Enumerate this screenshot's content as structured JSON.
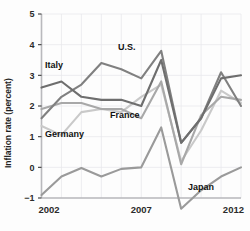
{
  "chart_data": {
    "type": "line",
    "title": "",
    "xlabel": "",
    "ylabel": "Inflation rate (percent)",
    "xlim": [
      2002,
      2012
    ],
    "ylim": [
      -1,
      5
    ],
    "grid": true,
    "legend_position": "inline-annotations",
    "x": [
      2002,
      2003,
      2004,
      2005,
      2006,
      2007,
      2008,
      2009,
      2010,
      2011,
      2012
    ],
    "y_ticks": [
      -1,
      0,
      1,
      2,
      3,
      4,
      5
    ],
    "y_tick_labels": [
      "−1",
      "0",
      "1",
      "2",
      "3",
      "4",
      "5"
    ],
    "x_ticks": [
      2002,
      2007,
      2012
    ],
    "x_tick_labels": [
      "2002",
      "2007",
      "2012"
    ],
    "series": [
      {
        "name": "Italy",
        "color": "#6e6e6e",
        "values": [
          2.6,
          2.8,
          2.3,
          2.2,
          2.2,
          2.0,
          3.5,
          0.8,
          1.6,
          2.9,
          3.0
        ]
      },
      {
        "name": "U.S.",
        "color": "#808080",
        "values": [
          1.6,
          2.3,
          2.7,
          3.4,
          3.2,
          2.9,
          3.8,
          0.8,
          1.6,
          3.1,
          2.0
        ]
      },
      {
        "name": "France",
        "color": "#a8a8a8",
        "values": [
          1.9,
          2.1,
          2.1,
          1.9,
          1.9,
          1.6,
          2.8,
          0.1,
          1.7,
          2.3,
          2.2
        ]
      },
      {
        "name": "Germany",
        "color": "#c9c9c9",
        "values": [
          1.35,
          1.05,
          1.8,
          1.9,
          1.8,
          2.3,
          2.7,
          0.2,
          1.2,
          2.5,
          2.1
        ]
      },
      {
        "name": "Japan",
        "color": "#9a9a9a",
        "values": [
          -0.9,
          -0.3,
          -0.02,
          -0.3,
          -0.05,
          0.0,
          1.3,
          -1.35,
          -0.75,
          -0.3,
          0.0
        ]
      }
    ],
    "annotations": [
      {
        "text": "Italy",
        "x_px": 45,
        "y_px": 68,
        "series": "Italy"
      },
      {
        "text": "U.S.",
        "x_px": 118,
        "y_px": 50,
        "series": "U.S."
      },
      {
        "text": "France",
        "x_px": 110,
        "y_px": 118,
        "series": "France"
      },
      {
        "text": "Germany",
        "x_px": 45,
        "y_px": 137,
        "series": "Germany"
      },
      {
        "text": "Japan",
        "x_px": 188,
        "y_px": 190,
        "series": "Japan"
      }
    ]
  },
  "axes": {
    "ylabel": "Inflation rate (percent)",
    "y_tick_labels": [
      "5",
      "4",
      "3",
      "2",
      "1",
      "0",
      "−1"
    ],
    "x_tick_labels": [
      "2002",
      "2007",
      "2012"
    ]
  },
  "colors": {
    "background": "#fdfdfd",
    "gridline": "#e9e9ec",
    "axis": "#b9b9bd",
    "text": "#1f1f1f"
  }
}
